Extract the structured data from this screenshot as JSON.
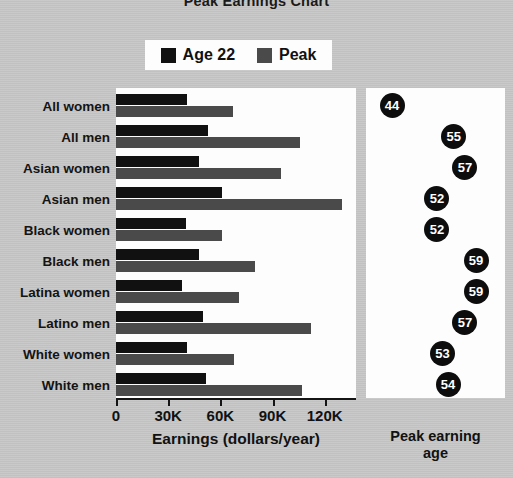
{
  "title": "Peak Earnings Chart",
  "legend": {
    "items": [
      {
        "label": "Age 22",
        "color": "#111111",
        "icon": "square-swatch"
      },
      {
        "label": "Peak",
        "color": "#4a4a4a",
        "icon": "square-swatch"
      }
    ]
  },
  "axis": {
    "x_title": "Earnings (dollars/year)",
    "ticks": [
      "0",
      "30K",
      "60K",
      "90K",
      "120K"
    ],
    "tick_values": [
      0,
      30000,
      60000,
      90000,
      120000
    ]
  },
  "peak_panel": {
    "title_line1": "Peak earning",
    "title_line2": "age"
  },
  "chart_data": {
    "type": "bar",
    "orientation": "horizontal",
    "title": "Peak Earnings Chart",
    "xlabel": "Earnings (dollars/year)",
    "ylabel": "",
    "xlim": [
      0,
      138000
    ],
    "grid": false,
    "legend_position": "top-center",
    "categories": [
      "All women",
      "All men",
      "Asian women",
      "Asian men",
      "Black women",
      "Black men",
      "Latina women",
      "Latino men",
      "White women",
      "White men"
    ],
    "series": [
      {
        "name": "Age 22",
        "color": "#111111",
        "values": [
          41000,
          53000,
          48000,
          61000,
          40000,
          48000,
          38000,
          50000,
          41000,
          52000
        ]
      },
      {
        "name": "Peak",
        "color": "#4a4a4a",
        "values": [
          67000,
          106000,
          95000,
          130000,
          61000,
          80000,
          71000,
          112000,
          68000,
          107000
        ]
      }
    ],
    "peak_earning_age": {
      "label": "Peak earning age",
      "values": [
        44,
        55,
        57,
        52,
        52,
        59,
        59,
        57,
        53,
        54
      ]
    }
  }
}
